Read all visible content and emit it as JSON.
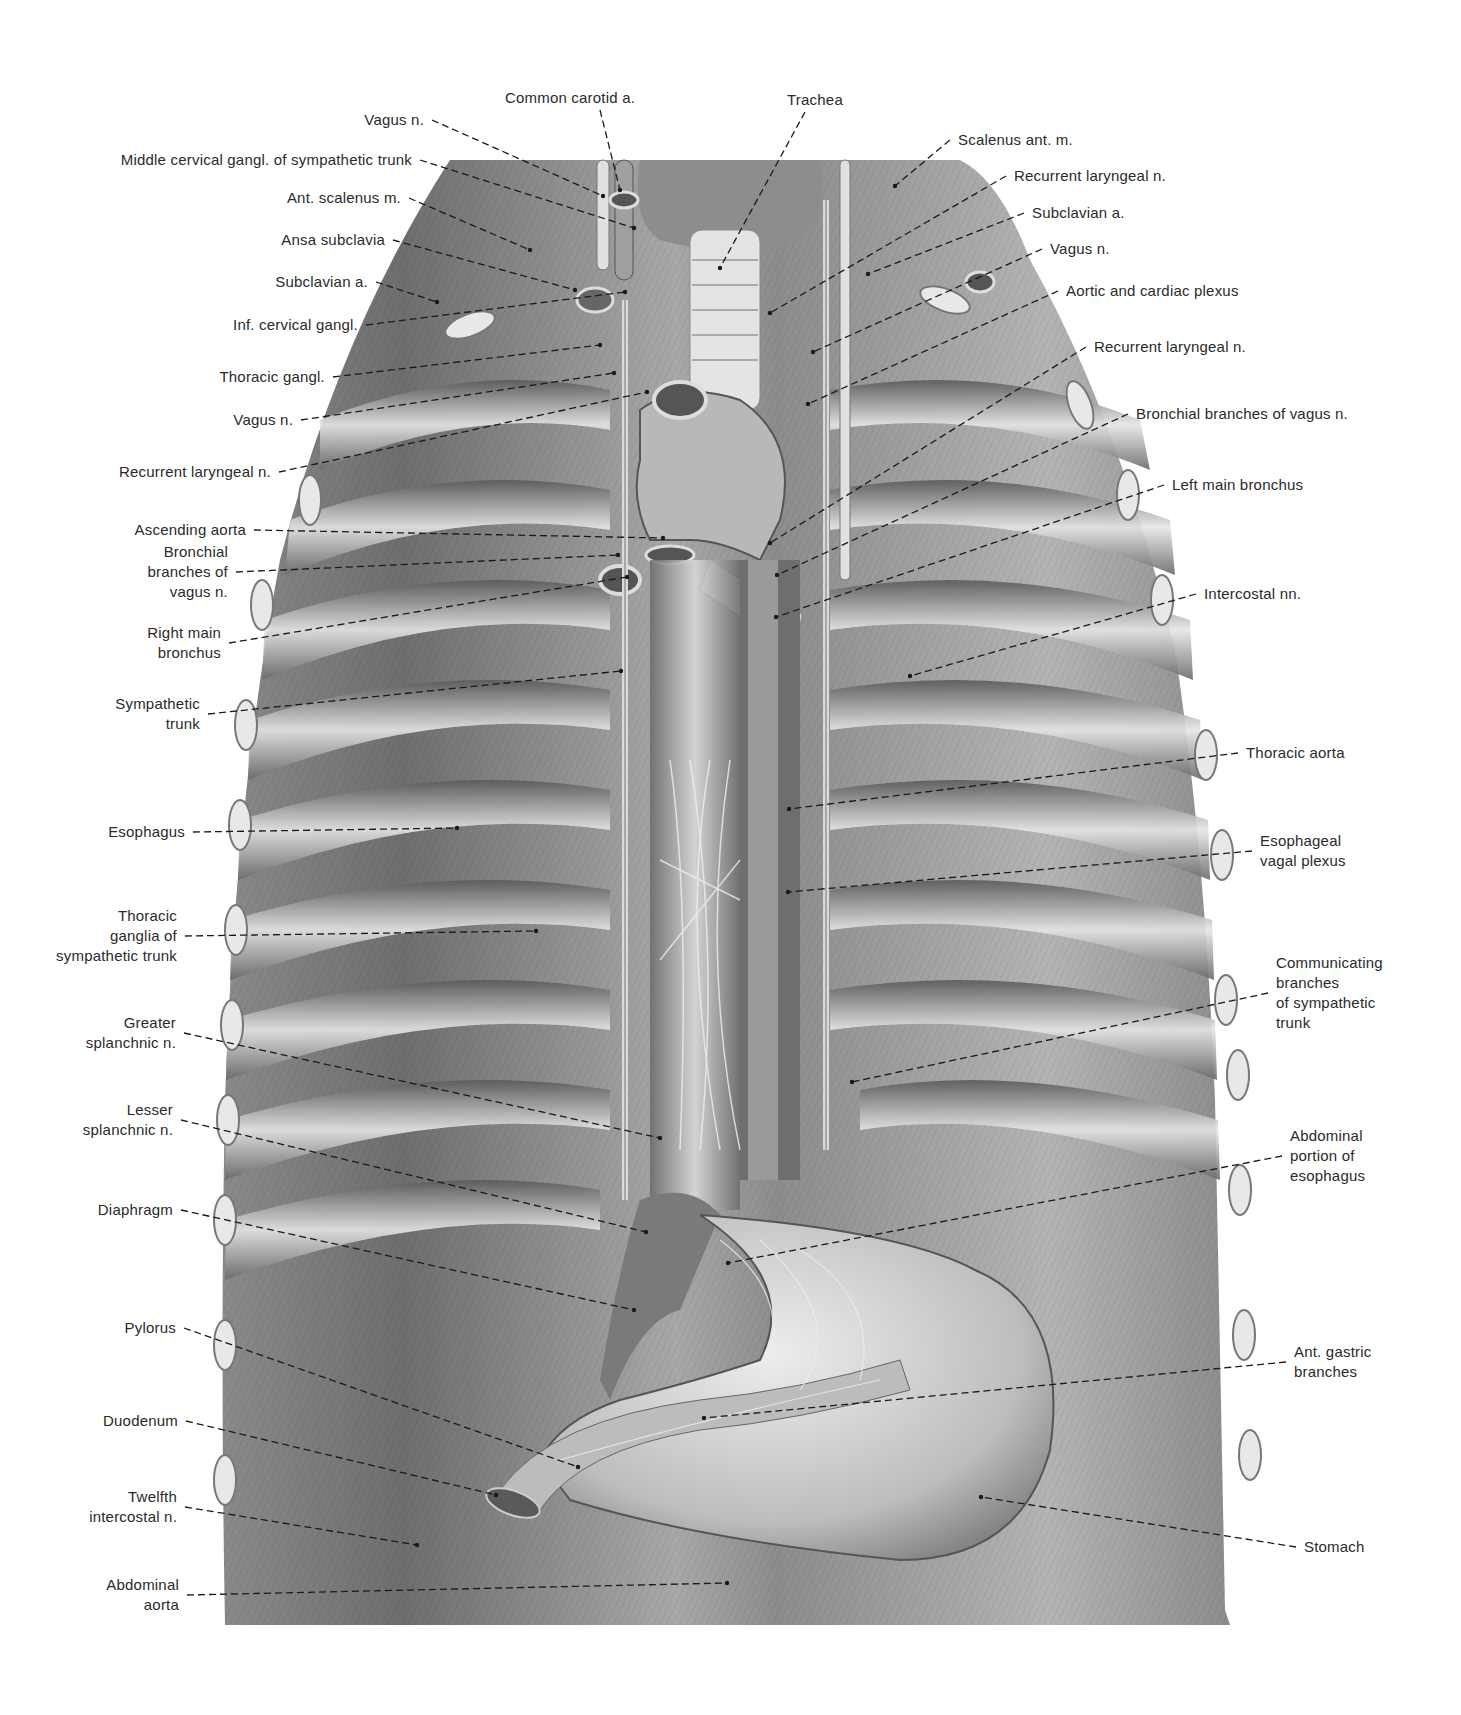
{
  "figure": {
    "background": "#ffffff",
    "ink_color": "#2a2a2a",
    "tissue_light": "#d9d9d9",
    "tissue_mid": "#9a9a9a",
    "tissue_dark": "#4a4a4a"
  },
  "labels_top": [
    {
      "id": "common-carotid-a",
      "text": "Common carotid a.",
      "x": 570,
      "y": 98,
      "align": "c",
      "tx": 620,
      "ty": 190
    },
    {
      "id": "trachea",
      "text": "Trachea",
      "x": 815,
      "y": 100,
      "align": "c",
      "tx": 720,
      "ty": 268
    }
  ],
  "labels_left": [
    {
      "id": "vagus-n-top",
      "text": "Vagus n.",
      "x": 432,
      "y": 120,
      "tx": 603,
      "ty": 196
    },
    {
      "id": "middle-cervical-gangl",
      "text": "Middle cervical gangl. of sympathetic trunk",
      "x": 420,
      "y": 160,
      "tx": 634,
      "ty": 228
    },
    {
      "id": "ant-scalenus-m",
      "text": "Ant. scalenus m.",
      "x": 409,
      "y": 198,
      "tx": 530,
      "ty": 250
    },
    {
      "id": "ansa-subclavia",
      "text": "Ansa subclavia",
      "x": 393,
      "y": 240,
      "tx": 575,
      "ty": 290
    },
    {
      "id": "subclavian-a-left",
      "text": "Subclavian a.",
      "x": 376,
      "y": 282,
      "tx": 437,
      "ty": 302
    },
    {
      "id": "inf-cervical-gangl",
      "text": "Inf. cervical gangl.",
      "x": 366,
      "y": 325,
      "tx": 625,
      "ty": 292
    },
    {
      "id": "thoracic-gangl",
      "text": "Thoracic gangl.",
      "x": 333,
      "y": 377,
      "tx": 600,
      "ty": 345
    },
    {
      "id": "vagus-n-left",
      "text": "Vagus n.",
      "x": 301,
      "y": 420,
      "tx": 614,
      "ty": 373
    },
    {
      "id": "recurrent-laryngeal-n-left",
      "text": "Recurrent laryngeal n.",
      "x": 279,
      "y": 472,
      "tx": 647,
      "ty": 392
    },
    {
      "id": "ascending-aorta",
      "text": "Ascending aorta",
      "x": 254,
      "y": 530,
      "tx": 663,
      "ty": 538
    },
    {
      "id": "bronchial-branches-vagus-left",
      "text": "Bronchial\nbranches of\nvagus n.",
      "x": 236,
      "y": 572,
      "tx": 618,
      "ty": 555
    },
    {
      "id": "right-main-bronchus",
      "text": "Right main\nbronchus",
      "x": 229,
      "y": 643,
      "tx": 627,
      "ty": 577
    },
    {
      "id": "sympathetic-trunk",
      "text": "Sympathetic\ntrunk",
      "x": 208,
      "y": 714,
      "tx": 621,
      "ty": 671
    },
    {
      "id": "esophagus",
      "text": "Esophagus",
      "x": 193,
      "y": 832,
      "tx": 457,
      "ty": 828
    },
    {
      "id": "thoracic-ganglia",
      "text": "Thoracic\nganglia of\nsympathetic trunk",
      "x": 185,
      "y": 936,
      "tx": 536,
      "ty": 931
    },
    {
      "id": "greater-splanchnic-n",
      "text": "Greater\nsplanchnic n.",
      "x": 184,
      "y": 1033,
      "tx": 660,
      "ty": 1138
    },
    {
      "id": "lesser-splanchnic-n",
      "text": "Lesser\nsplanchnic n.",
      "x": 181,
      "y": 1120,
      "tx": 646,
      "ty": 1232
    },
    {
      "id": "diaphragm",
      "text": "Diaphragm",
      "x": 181,
      "y": 1210,
      "tx": 634,
      "ty": 1310
    },
    {
      "id": "pylorus",
      "text": "Pylorus",
      "x": 184,
      "y": 1328,
      "tx": 578,
      "ty": 1467
    },
    {
      "id": "duodenum",
      "text": "Duodenum",
      "x": 186,
      "y": 1421,
      "tx": 496,
      "ty": 1495
    },
    {
      "id": "twelfth-intercostal-n",
      "text": "Twelfth\nintercostal n.",
      "x": 185,
      "y": 1507,
      "tx": 417,
      "ty": 1545
    },
    {
      "id": "abdominal-aorta",
      "text": "Abdominal\naorta",
      "x": 187,
      "y": 1595,
      "tx": 727,
      "ty": 1583
    }
  ],
  "labels_right": [
    {
      "id": "scalenus-ant-m",
      "text": "Scalenus ant. m.",
      "x": 950,
      "y": 140,
      "tx": 895,
      "ty": 186
    },
    {
      "id": "recurrent-laryngeal-n-right-top",
      "text": "Recurrent laryngeal n.",
      "x": 1006,
      "y": 176,
      "tx": 770,
      "ty": 313
    },
    {
      "id": "subclavian-a-right",
      "text": "Subclavian a.",
      "x": 1024,
      "y": 213,
      "tx": 868,
      "ty": 274
    },
    {
      "id": "vagus-n-right",
      "text": "Vagus n.",
      "x": 1042,
      "y": 249,
      "tx": 813,
      "ty": 352
    },
    {
      "id": "aortic-cardiac-plexus",
      "text": "Aortic and cardiac plexus",
      "x": 1058,
      "y": 291,
      "tx": 808,
      "ty": 404
    },
    {
      "id": "recurrent-laryngeal-n-right",
      "text": "Recurrent laryngeal n.",
      "x": 1086,
      "y": 347,
      "tx": 770,
      "ty": 543
    },
    {
      "id": "bronchial-branches-vagus-right",
      "text": "Bronchial branches of vagus n.",
      "x": 1128,
      "y": 414,
      "tx": 777,
      "ty": 575
    },
    {
      "id": "left-main-bronchus",
      "text": "Left main bronchus",
      "x": 1164,
      "y": 485,
      "tx": 776,
      "ty": 617
    },
    {
      "id": "intercostal-nn",
      "text": "Intercostal nn.",
      "x": 1196,
      "y": 594,
      "tx": 910,
      "ty": 676
    },
    {
      "id": "thoracic-aorta",
      "text": "Thoracic aorta",
      "x": 1238,
      "y": 753,
      "tx": 789,
      "ty": 809
    },
    {
      "id": "esophageal-vagal-plexus",
      "text": "Esophageal\nvagal plexus",
      "x": 1252,
      "y": 851,
      "tx": 788,
      "ty": 892
    },
    {
      "id": "communicating-branches",
      "text": "Communicating\nbranches\nof sympathetic\ntrunk",
      "x": 1268,
      "y": 993,
      "tx": 852,
      "ty": 1082
    },
    {
      "id": "abdominal-portion-esophagus",
      "text": "Abdominal\nportion of\nesophagus",
      "x": 1282,
      "y": 1156,
      "tx": 728,
      "ty": 1263
    },
    {
      "id": "ant-gastric-branches",
      "text": "Ant. gastric\nbranches",
      "x": 1286,
      "y": 1362,
      "tx": 704,
      "ty": 1418
    },
    {
      "id": "stomach",
      "text": "Stomach",
      "x": 1296,
      "y": 1547,
      "tx": 981,
      "ty": 1497
    }
  ]
}
